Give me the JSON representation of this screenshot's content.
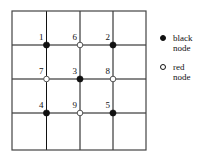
{
  "figure": {
    "grid": {
      "x_lines": [
        12,
        46.5,
        80,
        113,
        146
      ],
      "y_lines": [
        11,
        45,
        79,
        113,
        150
      ],
      "line_color": "#555555",
      "border_color": "#444444",
      "line_width": 1
    },
    "colors": {
      "black_node": "#111111",
      "red_node_fill": "#ffffff",
      "red_node_stroke": "#555555",
      "text": "#111111",
      "background": "#ffffff"
    },
    "nodes": [
      {
        "label": "1",
        "x": 46.5,
        "y": 45,
        "kind": "black"
      },
      {
        "label": "6",
        "x": 80,
        "y": 45,
        "kind": "red"
      },
      {
        "label": "2",
        "x": 113,
        "y": 45,
        "kind": "black"
      },
      {
        "label": "7",
        "x": 46.5,
        "y": 79,
        "kind": "red"
      },
      {
        "label": "3",
        "x": 80,
        "y": 79,
        "kind": "black"
      },
      {
        "label": "8",
        "x": 113,
        "y": 79,
        "kind": "red"
      },
      {
        "label": "4",
        "x": 46.5,
        "y": 113,
        "kind": "black"
      },
      {
        "label": "9",
        "x": 80,
        "y": 113,
        "kind": "red"
      },
      {
        "label": "5",
        "x": 113,
        "y": 113,
        "kind": "black"
      }
    ],
    "legend": {
      "items": [
        {
          "marker": "black-node-marker",
          "line1": "black",
          "line2": "node"
        },
        {
          "marker": "red-node-marker",
          "line1": "red",
          "line2": "node"
        }
      ]
    }
  },
  "chart_data": {
    "type": "scatter",
    "title": "",
    "xlabel": "",
    "ylabel": "",
    "grid": true,
    "grid_columns": 4,
    "grid_rows": 4,
    "legend_position": "right",
    "series": [
      {
        "name": "black node",
        "marker": "filled-circle",
        "points": [
          {
            "label": "1",
            "col": 1,
            "row": 1
          },
          {
            "label": "2",
            "col": 3,
            "row": 1
          },
          {
            "label": "3",
            "col": 2,
            "row": 2
          },
          {
            "label": "4",
            "col": 1,
            "row": 3
          },
          {
            "label": "5",
            "col": 3,
            "row": 3
          }
        ]
      },
      {
        "name": "red node",
        "marker": "open-circle",
        "points": [
          {
            "label": "6",
            "col": 2,
            "row": 1
          },
          {
            "label": "7",
            "col": 1,
            "row": 2
          },
          {
            "label": "8",
            "col": 3,
            "row": 2
          },
          {
            "label": "9",
            "col": 2,
            "row": 3
          }
        ]
      }
    ],
    "legend_entries": [
      "black node",
      "red node"
    ]
  }
}
